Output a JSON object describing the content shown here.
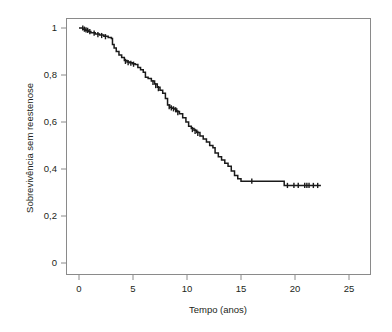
{
  "chart_data": {
    "type": "line",
    "subtype": "kaplan-meier-step",
    "title": "",
    "xlabel": "Tempo (anos)",
    "ylabel": "Sobrevivência sem reestenose",
    "xlim": [
      -0.6,
      26.4
    ],
    "ylim": [
      -0.05,
      1.08
    ],
    "xticks": [
      0,
      5,
      10,
      15,
      20,
      25
    ],
    "xtick_labels": [
      "0",
      "5",
      "10",
      "15",
      "20",
      "25"
    ],
    "yticks": [
      0,
      0.2,
      0.4,
      0.6,
      0.8,
      1
    ],
    "ytick_labels": [
      "0",
      "0,2",
      "0,4",
      "0,6",
      "0,8",
      "1"
    ],
    "grid": false,
    "legend": null,
    "series": [
      {
        "name": "Sobrevivência sem reestenose",
        "color": "#1a1a1a",
        "step": "post",
        "x": [
          0.0,
          0.35,
          0.6,
          0.85,
          1.1,
          1.5,
          1.9,
          2.3,
          2.7,
          3.0,
          3.1,
          3.25,
          3.45,
          3.7,
          3.95,
          4.2,
          4.45,
          4.7,
          4.95,
          5.2,
          5.45,
          5.7,
          5.95,
          6.15,
          6.4,
          6.7,
          7.0,
          7.25,
          7.5,
          7.75,
          8.0,
          8.2,
          8.4,
          8.6,
          8.8,
          9.05,
          9.3,
          9.6,
          9.9,
          10.15,
          10.4,
          10.65,
          10.9,
          11.2,
          11.5,
          11.8,
          12.1,
          12.4,
          12.6,
          12.9,
          13.2,
          13.5,
          13.8,
          14.1,
          14.4,
          14.7,
          15.0,
          19.0,
          22.4
        ],
        "y": [
          1.0,
          0.995,
          0.99,
          0.985,
          0.98,
          0.975,
          0.97,
          0.965,
          0.96,
          0.955,
          0.93,
          0.915,
          0.9,
          0.885,
          0.875,
          0.862,
          0.855,
          0.852,
          0.848,
          0.845,
          0.832,
          0.822,
          0.812,
          0.79,
          0.785,
          0.775,
          0.762,
          0.748,
          0.735,
          0.722,
          0.7,
          0.672,
          0.662,
          0.658,
          0.655,
          0.645,
          0.635,
          0.618,
          0.6,
          0.582,
          0.572,
          0.565,
          0.555,
          0.54,
          0.528,
          0.515,
          0.5,
          0.49,
          0.468,
          0.452,
          0.438,
          0.425,
          0.412,
          0.392,
          0.372,
          0.358,
          0.348,
          0.33,
          0.33
        ]
      }
    ],
    "censored": [
      {
        "x": 0.35,
        "y": 1.0
      },
      {
        "x": 0.5,
        "y": 0.995
      },
      {
        "x": 0.65,
        "y": 0.992
      },
      {
        "x": 0.8,
        "y": 0.99
      },
      {
        "x": 1.0,
        "y": 0.985
      },
      {
        "x": 1.4,
        "y": 0.978
      },
      {
        "x": 1.75,
        "y": 0.972
      },
      {
        "x": 2.1,
        "y": 0.968
      },
      {
        "x": 2.45,
        "y": 0.963
      },
      {
        "x": 4.3,
        "y": 0.858
      },
      {
        "x": 4.55,
        "y": 0.853
      },
      {
        "x": 4.8,
        "y": 0.85
      },
      {
        "x": 5.05,
        "y": 0.846
      },
      {
        "x": 6.85,
        "y": 0.768
      },
      {
        "x": 7.1,
        "y": 0.755
      },
      {
        "x": 7.35,
        "y": 0.742
      },
      {
        "x": 8.35,
        "y": 0.665
      },
      {
        "x": 8.55,
        "y": 0.66
      },
      {
        "x": 8.75,
        "y": 0.656
      },
      {
        "x": 8.95,
        "y": 0.652
      },
      {
        "x": 9.15,
        "y": 0.64
      },
      {
        "x": 10.5,
        "y": 0.568
      },
      {
        "x": 10.75,
        "y": 0.56
      },
      {
        "x": 11.0,
        "y": 0.552
      },
      {
        "x": 16.0,
        "y": 0.348
      },
      {
        "x": 19.3,
        "y": 0.33
      },
      {
        "x": 19.9,
        "y": 0.33
      },
      {
        "x": 20.3,
        "y": 0.33
      },
      {
        "x": 20.9,
        "y": 0.33
      },
      {
        "x": 21.1,
        "y": 0.33
      },
      {
        "x": 21.3,
        "y": 0.33
      },
      {
        "x": 21.7,
        "y": 0.33
      },
      {
        "x": 22.1,
        "y": 0.33
      }
    ]
  },
  "axes": {
    "frame_color": "#8a8a8a",
    "text_color": "#231f20",
    "curve_color": "#1a1a1a"
  }
}
